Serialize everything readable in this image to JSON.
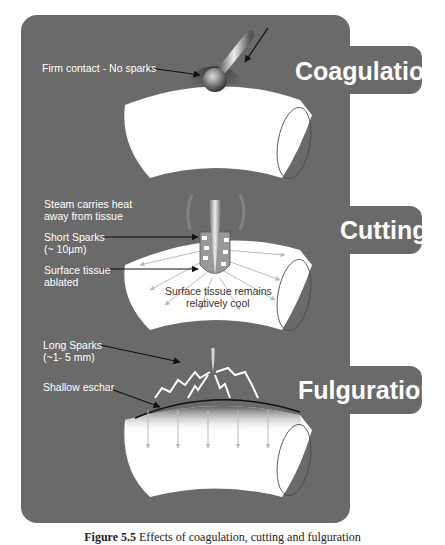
{
  "sections": [
    {
      "title": "Coagulation",
      "labels": [
        "Firm contact - No sparks"
      ]
    },
    {
      "title": "Cutting",
      "labels": [
        "Steam carries heat",
        "away from tissue",
        "Short Sparks",
        "(~ 10µm)",
        "Surface tissue",
        "ablated",
        "Surface tissue remains",
        "relatively cool"
      ]
    },
    {
      "title": "Fulguration",
      "labels": [
        "Long Sparks",
        "(~1- 5 mm)",
        "Shallow eschar"
      ]
    }
  ],
  "caption": {
    "prefix": "Figure 5.5",
    "text": "Effects of coagulation, cutting and fulguration"
  },
  "colors": {
    "panel": "#6a6a6a",
    "tissue": "#ffffff",
    "text": "#ffffff"
  }
}
